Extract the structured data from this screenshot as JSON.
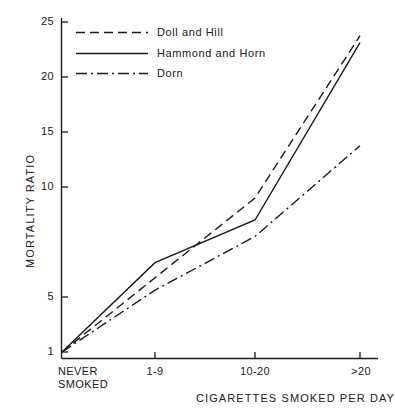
{
  "chart_data": {
    "type": "line",
    "title": "",
    "xlabel": "CIGARETTES SMOKED PER DAY",
    "ylabel": "MORTALITY RATIO",
    "categories": [
      "NEVER SMOKED",
      "1-9",
      "10-20",
      ">20"
    ],
    "category_labels_multiline": [
      [
        "NEVER",
        "SMOKED"
      ],
      [
        "1-9"
      ],
      [
        "10-20"
      ],
      [
        ">20"
      ]
    ],
    "yticks": [
      1,
      5,
      10,
      15,
      20,
      25
    ],
    "ytick_labels": [
      "1",
      "5",
      "10",
      "15",
      "20",
      "25"
    ],
    "ylim": [
      1,
      25
    ],
    "grid": false,
    "legend_position": "top-left-inside",
    "series": [
      {
        "name": "Doll and Hill",
        "style": "dashed",
        "color": "#1a1a1a",
        "values": [
          1,
          6.4,
          12.2,
          24.0
        ]
      },
      {
        "name": "Hammond and Horn",
        "style": "solid",
        "color": "#1a1a1a",
        "values": [
          1,
          7.5,
          10.6,
          23.5
        ]
      },
      {
        "name": "Dorn",
        "style": "dash-dot",
        "color": "#1a1a1a",
        "values": [
          1,
          5.5,
          9.4,
          16.0
        ]
      }
    ]
  },
  "axis": {
    "y_title": "MORTALITY RATIO",
    "x_title": "CIGARETTES SMOKED PER DAY",
    "ytick_labels": [
      "25",
      "20",
      "15",
      "10",
      "5",
      "1"
    ],
    "xtick_labels": [
      "NEVER",
      "SMOKED",
      "1-9",
      "10-20",
      ">20"
    ]
  },
  "legend": {
    "entries": [
      {
        "label": "Doll and Hill",
        "style": "dashed"
      },
      {
        "label": "Hammond and Horn",
        "style": "solid"
      },
      {
        "label": "Dorn",
        "style": "dash-dot"
      }
    ]
  },
  "colors": {
    "ink": "#1a1a1a",
    "background": "#ffffff"
  }
}
